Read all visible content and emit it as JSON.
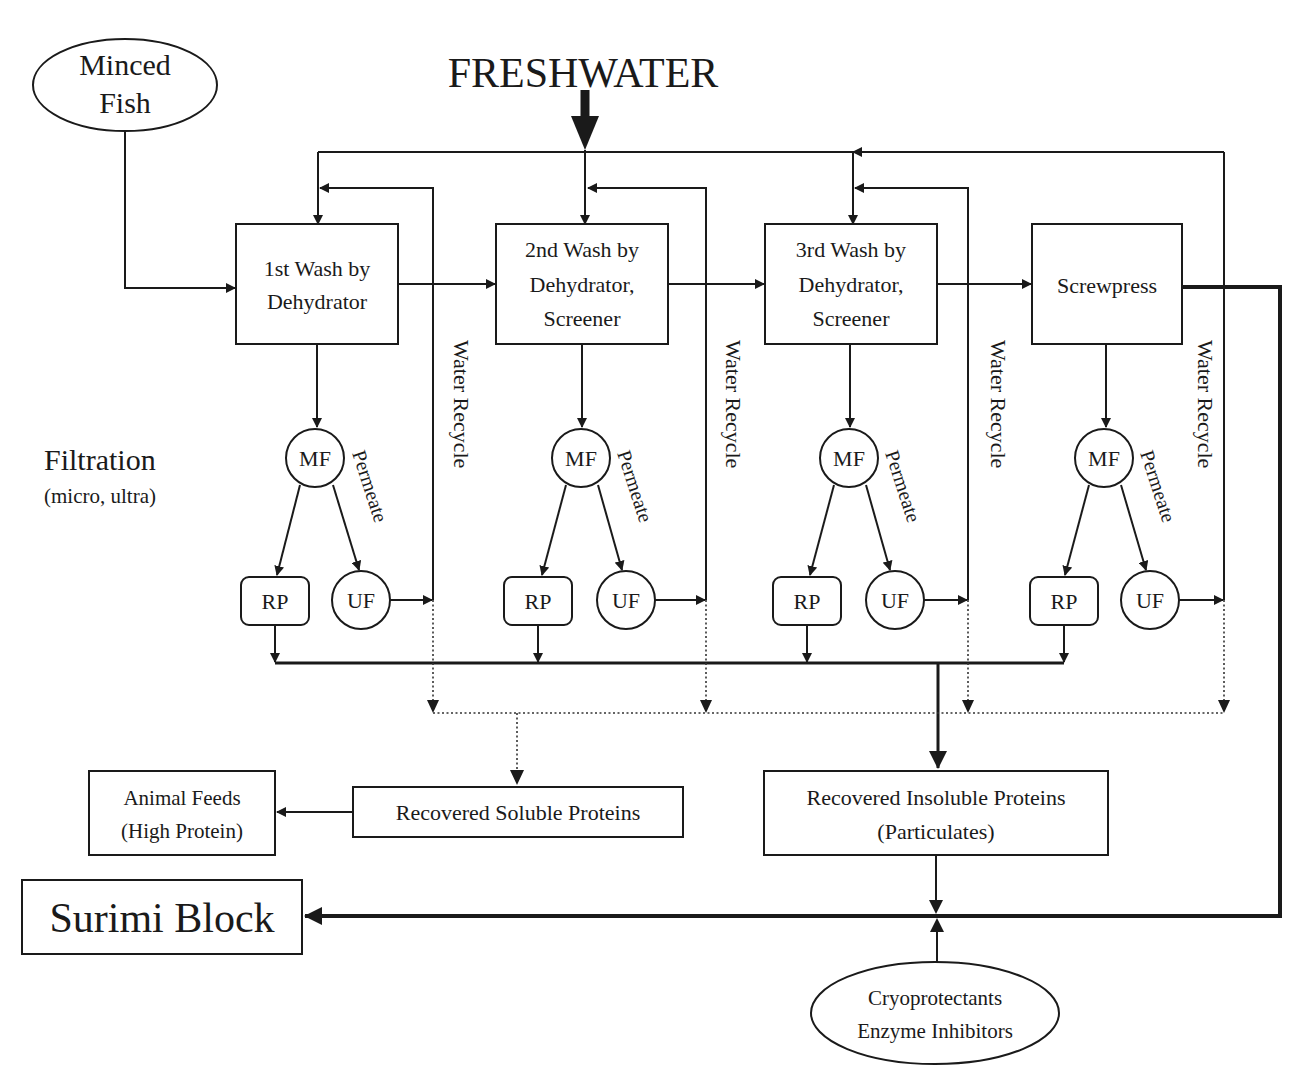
{
  "diagram": {
    "title_input": "FRESHWATER",
    "source": {
      "line1": "Minced",
      "line2": "Fish"
    },
    "filtration_label": {
      "title": "Filtration",
      "subtitle": "(micro, ultra)"
    },
    "stages": [
      {
        "lines": [
          "1st Wash by",
          "Dehydrator"
        ]
      },
      {
        "lines": [
          "2nd Wash by",
          "Dehydrator,",
          "Screener"
        ]
      },
      {
        "lines": [
          "3rd Wash by",
          "Dehydrator,",
          "Screener"
        ]
      },
      {
        "lines": [
          "Screwpress"
        ]
      }
    ],
    "node_labels": {
      "mf": "MF",
      "uf": "UF",
      "rp": "RP",
      "permeate": "Permeate",
      "water_recycle": "Water Recycle"
    },
    "outputs": {
      "soluble": "Recovered Soluble Proteins",
      "insoluble": {
        "line1": "Recovered Insoluble Proteins",
        "line2": "(Particulates)"
      },
      "animal_feeds": {
        "line1": "Animal Feeds",
        "line2": "(High Protein)"
      },
      "surimi": "Surimi Block",
      "additives": {
        "line1": "Cryoprotectants",
        "line2": "Enzyme Inhibitors"
      }
    },
    "colors": {
      "line": "#1a1a1a",
      "background": "#ffffff"
    }
  }
}
